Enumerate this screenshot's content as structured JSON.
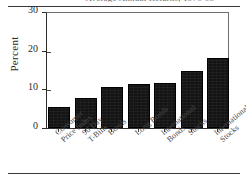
{
  "figure": {
    "caption": "Average Annual Returns, 1970-95",
    "background_color": "#ffffff",
    "bar_color": "#141414",
    "axis_color": "#2e2e2e"
  },
  "chart_data": {
    "type": "bar",
    "title": "",
    "xlabel": "",
    "ylabel": "Percent",
    "ylim": [
      0,
      30
    ],
    "yticks": [
      0,
      10,
      20,
      30
    ],
    "ytick_labels": [
      "0",
      "10",
      "20",
      "30"
    ],
    "grid": false,
    "legend": "none",
    "categories": [
      "Consumer Price Index",
      "90 Day T-Bills",
      "Bonds",
      "Long Bonds",
      "International Bonds",
      "Stocks",
      "International Stocks"
    ],
    "category_lines": [
      [
        "Consumer",
        "Price Index"
      ],
      [
        "90 Day",
        "T-Bills"
      ],
      [
        "Bonds"
      ],
      [
        "Long Bonds"
      ],
      [
        "International",
        "Bonds"
      ],
      [
        "Stocks"
      ],
      [
        "International",
        "Stocks"
      ]
    ],
    "values": [
      5.5,
      7.8,
      10.6,
      11.3,
      11.6,
      14.7,
      18.0
    ]
  }
}
